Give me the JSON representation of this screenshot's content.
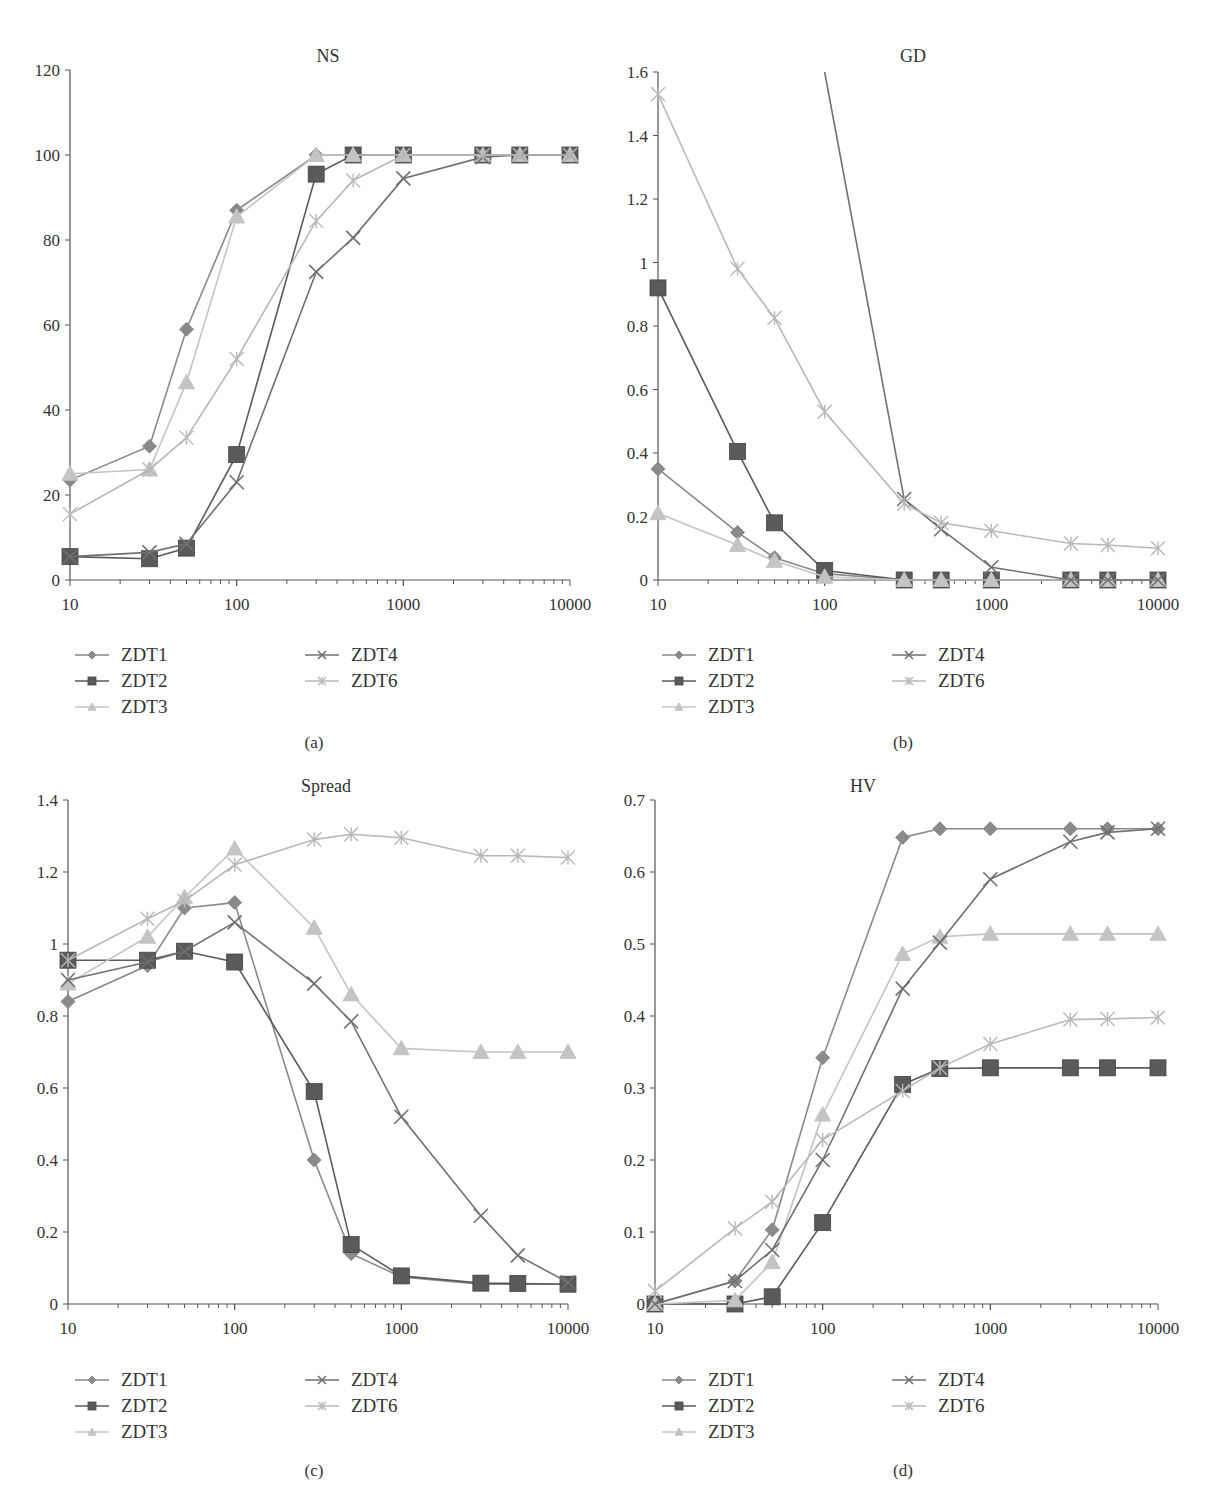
{
  "figure": {
    "panels": [
      "(a)",
      "(b)",
      "(c)",
      "(d)"
    ]
  },
  "series_styles": {
    "ZDT1": {
      "color": "#8a8a8a",
      "marker": "diamond"
    },
    "ZDT2": {
      "color": "#5a5a5a",
      "marker": "square"
    },
    "ZDT3": {
      "color": "#c4c4c4",
      "marker": "triangle"
    },
    "ZDT4": {
      "color": "#707070",
      "marker": "x"
    },
    "ZDT6": {
      "color": "#b8b8b8",
      "marker": "star"
    }
  },
  "legend": {
    "entries": [
      "ZDT1",
      "ZDT2",
      "ZDT3",
      "ZDT4",
      "ZDT6"
    ]
  },
  "chart_data": [
    {
      "type": "line",
      "panel": "(a)",
      "title": "NS",
      "xlabel": "",
      "ylabel": "",
      "xscale": "log",
      "xlim": [
        10,
        10000
      ],
      "ylim": [
        0,
        120
      ],
      "yticks": [
        0,
        20,
        40,
        60,
        80,
        100,
        120
      ],
      "xticks": [
        10,
        100,
        1000,
        10000
      ],
      "grid": false,
      "legend_position": "bottom",
      "x": [
        10,
        30,
        50,
        100,
        300,
        500,
        1000,
        3000,
        5000,
        10000
      ],
      "series": [
        {
          "name": "ZDT1",
          "values": [
            23.5,
            31.5,
            59,
            87,
            100,
            100,
            100,
            100,
            100,
            100
          ]
        },
        {
          "name": "ZDT2",
          "values": [
            5.5,
            5,
            7.5,
            29.5,
            95.5,
            100,
            100,
            100,
            100,
            100
          ]
        },
        {
          "name": "ZDT3",
          "values": [
            25,
            26,
            46.5,
            85.5,
            100,
            100,
            100,
            100,
            100,
            100
          ]
        },
        {
          "name": "ZDT4",
          "values": [
            5.5,
            6.5,
            8.5,
            23,
            72.5,
            80.5,
            94.5,
            99.5,
            100,
            100
          ]
        },
        {
          "name": "ZDT6",
          "values": [
            15.5,
            26,
            33.5,
            52,
            84.5,
            94,
            100,
            100,
            100,
            100
          ]
        }
      ]
    },
    {
      "type": "line",
      "panel": "(b)",
      "title": "GD",
      "xlabel": "",
      "ylabel": "",
      "xscale": "log",
      "xlim": [
        10,
        10000
      ],
      "ylim": [
        0,
        1.6
      ],
      "yticks": [
        0,
        0.2,
        0.4,
        0.6,
        0.8,
        1,
        1.2,
        1.4,
        1.6
      ],
      "xticks": [
        10,
        100,
        1000,
        10000
      ],
      "grid": false,
      "legend_position": "bottom",
      "x": [
        10,
        30,
        50,
        100,
        300,
        500,
        1000,
        3000,
        5000,
        10000
      ],
      "annotations": [
        "ZDT4 values at x=10..100 exceed the 1.6 axis limit (line enters from the top near x=100)"
      ],
      "series": [
        {
          "name": "ZDT1",
          "values": [
            0.35,
            0.15,
            0.07,
            0.02,
            0,
            0,
            0,
            0,
            0,
            0
          ]
        },
        {
          "name": "ZDT2",
          "values": [
            0.92,
            0.405,
            0.18,
            0.03,
            0,
            0,
            0,
            0,
            0,
            0
          ]
        },
        {
          "name": "ZDT3",
          "values": [
            0.21,
            0.11,
            0.06,
            0.01,
            0,
            0,
            0,
            0,
            0,
            0
          ]
        },
        {
          "name": "ZDT4",
          "values": [
            null,
            null,
            null,
            1.6,
            0.255,
            0.16,
            0.04,
            0,
            0,
            0
          ]
        },
        {
          "name": "ZDT6",
          "values": [
            1.53,
            0.98,
            0.825,
            0.53,
            0.24,
            0.18,
            0.155,
            0.115,
            0.11,
            0.1
          ]
        }
      ]
    },
    {
      "type": "line",
      "panel": "(c)",
      "title": "Spread",
      "xlabel": "",
      "ylabel": "",
      "xscale": "log",
      "xlim": [
        10,
        10000
      ],
      "ylim": [
        0,
        1.4
      ],
      "yticks": [
        0,
        0.2,
        0.4,
        0.6,
        0.8,
        1,
        1.2,
        1.4
      ],
      "xticks": [
        10,
        100,
        1000,
        10000
      ],
      "grid": false,
      "legend_position": "bottom",
      "x": [
        10,
        30,
        50,
        100,
        300,
        500,
        1000,
        3000,
        5000,
        10000
      ],
      "series": [
        {
          "name": "ZDT1",
          "values": [
            0.84,
            0.94,
            1.1,
            1.115,
            0.4,
            0.14,
            0.075,
            0.055,
            0.055,
            0.055
          ]
        },
        {
          "name": "ZDT2",
          "values": [
            0.955,
            0.955,
            0.98,
            0.95,
            0.59,
            0.165,
            0.078,
            0.058,
            0.057,
            0.055
          ]
        },
        {
          "name": "ZDT3",
          "values": [
            0.89,
            1.02,
            1.13,
            1.265,
            1.045,
            0.86,
            0.71,
            0.7,
            0.7,
            0.7
          ]
        },
        {
          "name": "ZDT4",
          "values": [
            0.9,
            0.95,
            0.98,
            1.06,
            0.89,
            0.785,
            0.52,
            0.245,
            0.135,
            0.06
          ]
        },
        {
          "name": "ZDT6",
          "values": [
            0.955,
            1.07,
            1.12,
            1.22,
            1.29,
            1.305,
            1.295,
            1.245,
            1.245,
            1.24
          ]
        }
      ]
    },
    {
      "type": "line",
      "panel": "(d)",
      "title": "HV",
      "xlabel": "",
      "ylabel": "",
      "xscale": "log",
      "xlim": [
        10,
        10000
      ],
      "ylim": [
        0,
        0.7
      ],
      "yticks": [
        0,
        0.1,
        0.2,
        0.3,
        0.4,
        0.5,
        0.6,
        0.7
      ],
      "xticks": [
        10,
        100,
        1000,
        10000
      ],
      "grid": false,
      "legend_position": "bottom",
      "x": [
        10,
        30,
        50,
        100,
        300,
        500,
        1000,
        3000,
        5000,
        10000
      ],
      "series": [
        {
          "name": "ZDT1",
          "values": [
            0,
            0.032,
            0.103,
            0.342,
            0.648,
            0.66,
            0.66,
            0.66,
            0.66,
            0.66
          ]
        },
        {
          "name": "ZDT2",
          "values": [
            0,
            0,
            0.01,
            0.113,
            0.305,
            0.327,
            0.328,
            0.328,
            0.328,
            0.328
          ]
        },
        {
          "name": "ZDT3",
          "values": [
            0,
            0.005,
            0.058,
            0.263,
            0.486,
            0.51,
            0.514,
            0.514,
            0.514,
            0.514
          ]
        },
        {
          "name": "ZDT4",
          "values": [
            0,
            0.032,
            0.075,
            0.2,
            0.438,
            0.502,
            0.59,
            0.642,
            0.655,
            0.66
          ]
        },
        {
          "name": "ZDT6",
          "values": [
            0.018,
            0.105,
            0.142,
            0.228,
            0.296,
            0.328,
            0.361,
            0.395,
            0.396,
            0.398
          ]
        }
      ]
    }
  ]
}
